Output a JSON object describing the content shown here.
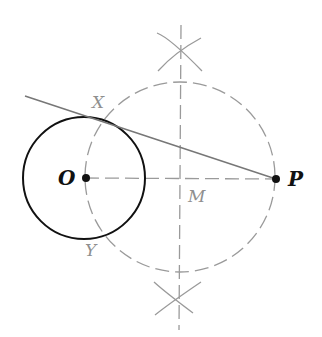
{
  "diagram": {
    "colors": {
      "background": "#ffffff",
      "primary": "#111111",
      "construction": "#9a9a9a",
      "tangent": "#777777",
      "label_light": "#8f8f8f"
    },
    "points": {
      "O": {
        "label": "O",
        "x": 85,
        "y": 178
      },
      "P": {
        "label": "P",
        "x": 276,
        "y": 179
      },
      "M": {
        "label": "M",
        "x": 181,
        "y": 178
      },
      "X": {
        "label": "X",
        "x": 104,
        "y": 117
      },
      "Y": {
        "label": "Y",
        "x": 101,
        "y": 236
      }
    },
    "labels": {
      "O": "O",
      "P": "P",
      "M": "M",
      "X": "X",
      "Y": "Y"
    },
    "elements": [
      {
        "type": "circle",
        "name": "given-circle",
        "center": "O",
        "radius": 61,
        "style": "solid"
      },
      {
        "type": "circle",
        "name": "construction-circle",
        "center": "M",
        "radius": 95,
        "style": "dashed"
      },
      {
        "type": "line",
        "name": "line-OP",
        "from": "O",
        "to": "P",
        "style": "dashed"
      },
      {
        "type": "line",
        "name": "perpendicular-bisector",
        "style": "dashed"
      },
      {
        "type": "line",
        "name": "tangent-PX",
        "from": "P",
        "through": "X",
        "style": "solid"
      },
      {
        "type": "arcs",
        "name": "bisector-arcs-top"
      },
      {
        "type": "arcs",
        "name": "bisector-arcs-bottom"
      }
    ]
  }
}
